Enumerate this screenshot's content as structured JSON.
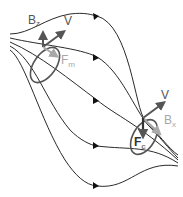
{
  "diagram": {
    "type": "magnetic-field-lines-with-flux-loops",
    "colors": {
      "field_line": "#2a2a2a",
      "loop": "#555555",
      "dark_vector": "#555555",
      "light_vector": "#a8a8a8",
      "label_dark": "#555555",
      "label_light": "#a8a8a8"
    },
    "left_loop": {
      "labels": {
        "bz": {
          "main": "B",
          "sub": "z"
        },
        "v": {
          "main": "V"
        },
        "fm": {
          "main": "F",
          "sub": "m"
        }
      }
    },
    "right_loop": {
      "labels": {
        "v": {
          "main": "V"
        },
        "bx": {
          "main": "B",
          "sub": "x"
        },
        "fc": {
          "main": "F",
          "sub": "c"
        }
      }
    },
    "field_line_count": 5
  }
}
